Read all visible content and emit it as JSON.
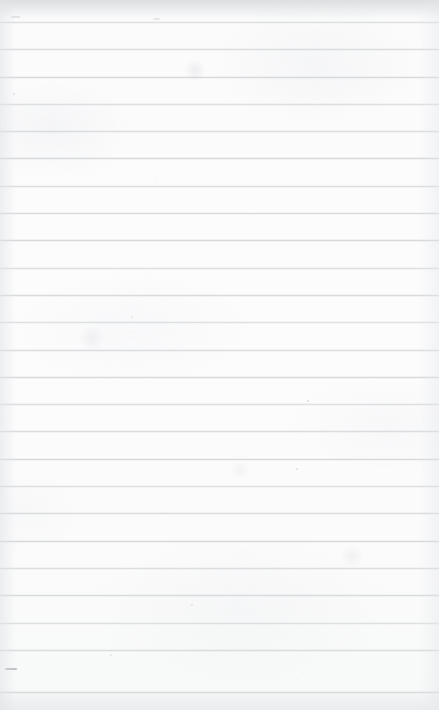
{
  "document": {
    "kind": "scanned-page",
    "title": "Blank ruled notebook page",
    "content_text": "",
    "visible_text": "",
    "paper_color": "#fbfbfc",
    "rule_color": "#d6d9da",
    "edge_shadow_color": "#d6d9db",
    "width_px": 439,
    "height_px": 710
  },
  "ruling": {
    "style": "horizontal-ruled",
    "line_count": 25,
    "first_line_y": 22,
    "line_spacing_px": 27.3,
    "line_thickness_px": 1,
    "margin_line": "none",
    "lines_y": [
      22,
      49,
      77,
      104,
      131,
      158,
      186,
      213,
      240,
      268,
      295,
      322,
      350,
      377,
      404,
      431,
      459,
      486,
      513,
      541,
      568,
      595,
      623,
      650,
      692
    ]
  },
  "marks": {
    "specks": [
      {
        "x": 13,
        "y": 93,
        "size": 2.0,
        "opacity": 0.42
      },
      {
        "x": 155,
        "y": 183,
        "size": 1.4,
        "opacity": 0.3
      },
      {
        "x": 218,
        "y": 225,
        "size": 1.3,
        "opacity": 0.26
      },
      {
        "x": 131,
        "y": 316,
        "size": 1.5,
        "opacity": 0.3
      },
      {
        "x": 307,
        "y": 400,
        "size": 2.0,
        "opacity": 0.45
      },
      {
        "x": 330,
        "y": 343,
        "size": 1.3,
        "opacity": 0.26
      },
      {
        "x": 296,
        "y": 468,
        "size": 1.8,
        "opacity": 0.4
      },
      {
        "x": 382,
        "y": 466,
        "size": 1.4,
        "opacity": 0.28
      },
      {
        "x": 160,
        "y": 512,
        "size": 1.3,
        "opacity": 0.26
      },
      {
        "x": 246,
        "y": 549,
        "size": 1.4,
        "opacity": 0.28
      },
      {
        "x": 191,
        "y": 604,
        "size": 1.5,
        "opacity": 0.3
      },
      {
        "x": 285,
        "y": 612,
        "size": 1.3,
        "opacity": 0.26
      },
      {
        "x": 41,
        "y": 649,
        "size": 1.4,
        "opacity": 0.28
      },
      {
        "x": 110,
        "y": 654,
        "size": 1.5,
        "opacity": 0.3
      },
      {
        "x": 302,
        "y": 672,
        "size": 1.3,
        "opacity": 0.26
      },
      {
        "x": 156,
        "y": 681,
        "size": 1.3,
        "opacity": 0.26
      },
      {
        "x": 88,
        "y": 261,
        "size": 1.2,
        "opacity": 0.22
      },
      {
        "x": 258,
        "y": 116,
        "size": 1.2,
        "opacity": 0.22
      }
    ],
    "dashes": [
      {
        "x": 5,
        "y": 668,
        "width": 12,
        "opacity": 0.55
      },
      {
        "x": 11,
        "y": 16,
        "width": 9,
        "opacity": 0.22
      },
      {
        "x": 153,
        "y": 18,
        "width": 7,
        "opacity": 0.18
      }
    ],
    "smudges": [
      {
        "x": 195,
        "y": 70,
        "size": 22,
        "opacity": 0.3
      },
      {
        "x": 92,
        "y": 338,
        "size": 26,
        "opacity": 0.22
      },
      {
        "x": 352,
        "y": 556,
        "size": 24,
        "opacity": 0.22
      },
      {
        "x": 240,
        "y": 470,
        "size": 20,
        "opacity": 0.2
      }
    ]
  }
}
